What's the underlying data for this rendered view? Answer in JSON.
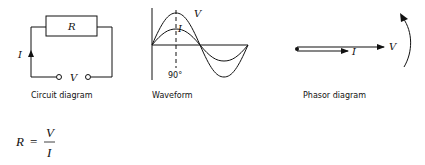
{
  "circuit": {
    "caption": "Circuit diagram",
    "resistor_label": "R",
    "current_label": "I",
    "voltage_label": "V"
  },
  "waveform": {
    "caption": "Waveform",
    "voltage_label": "V",
    "current_label": "I",
    "angle_label": "90°"
  },
  "phasor": {
    "caption": "Phasor diagram",
    "voltage_label": "V",
    "current_label": "I"
  },
  "equation": {
    "lhs": "R",
    "equals": "=",
    "numerator": "V",
    "denominator": "I"
  },
  "colors": {
    "ink": "#111111",
    "background": "#ffffff"
  }
}
